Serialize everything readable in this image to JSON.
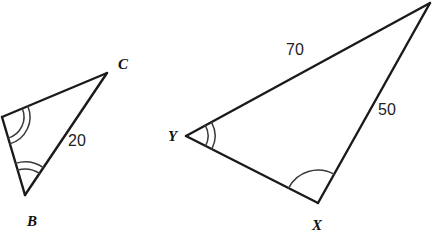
{
  "figure": {
    "background_color": "#ffffff",
    "line_color": "#1a1a1a",
    "arc_color": "#3a3a3a",
    "label_color": "#111111"
  },
  "triangles": [
    {
      "name": "triangle-abc",
      "vertices": [
        {
          "id": "A",
          "label": "",
          "x": 2,
          "y": 117,
          "label_x": 0,
          "label_y": 0,
          "arcs": 2,
          "arc_radius": 22,
          "arc_gap": 6
        },
        {
          "id": "C",
          "label": "C",
          "x": 107,
          "y": 73,
          "label_x": 118,
          "label_y": 69,
          "arcs": 0,
          "arc_radius": 0,
          "arc_gap": 0
        },
        {
          "id": "B",
          "label": "B",
          "x": 25,
          "y": 195,
          "label_x": 27,
          "label_y": 226,
          "arcs": 2,
          "arc_radius": 26,
          "arc_gap": 7
        }
      ],
      "sides": [
        {
          "from": "A",
          "to": "C",
          "label": "",
          "label_x": 0,
          "label_y": 0
        },
        {
          "from": "C",
          "to": "B",
          "label": "20",
          "label_x": 68,
          "label_y": 146
        },
        {
          "from": "B",
          "to": "A",
          "label": "",
          "label_x": 0,
          "label_y": 0
        }
      ]
    },
    {
      "name": "triangle-xyz",
      "vertices": [
        {
          "id": "Z",
          "label": "",
          "x": 430,
          "y": 3,
          "label_x": 0,
          "label_y": 0,
          "arcs": 0,
          "arc_radius": 0,
          "arc_gap": 0
        },
        {
          "id": "Y",
          "label": "Y",
          "x": 186,
          "y": 136,
          "label_x": 168,
          "label_y": 141,
          "arcs": 2,
          "arc_radius": 22,
          "arc_gap": 7
        },
        {
          "id": "X",
          "label": "X",
          "x": 318,
          "y": 203,
          "label_x": 312,
          "label_y": 230,
          "arcs": 1,
          "arc_radius": 33,
          "arc_gap": 0
        }
      ],
      "sides": [
        {
          "from": "Y",
          "to": "Z",
          "label": "70",
          "label_x": 286,
          "label_y": 55
        },
        {
          "from": "Z",
          "to": "X",
          "label": "50",
          "label_x": 378,
          "label_y": 115
        },
        {
          "from": "X",
          "to": "Y",
          "label": "",
          "label_x": 0,
          "label_y": 0
        }
      ]
    }
  ],
  "measure_labels": [
    {
      "name": "measure-20",
      "text": "20"
    },
    {
      "name": "measure-70",
      "text": "70"
    },
    {
      "name": "measure-50",
      "text": "50"
    }
  ],
  "vertex_labels": [
    {
      "name": "vertex-label-c",
      "text": "C"
    },
    {
      "name": "vertex-label-b",
      "text": "B"
    },
    {
      "name": "vertex-label-y",
      "text": "Y"
    },
    {
      "name": "vertex-label-x",
      "text": "X"
    }
  ]
}
